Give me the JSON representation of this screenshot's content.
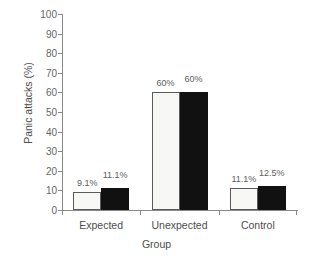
{
  "chart_data": {
    "type": "bar",
    "title": "",
    "xlabel": "Group",
    "ylabel": "Panic attacks (%)",
    "categories": [
      "Expected",
      "Unexpected",
      "Control"
    ],
    "ylim": [
      0,
      100
    ],
    "yticks": [
      0,
      10,
      20,
      30,
      40,
      50,
      60,
      70,
      80,
      90,
      100
    ],
    "ytick_labels": [
      "0",
      "10",
      "20",
      "30",
      "40",
      "50",
      "60",
      "70",
      "80",
      "90",
      "100"
    ],
    "grid": false,
    "legend": null,
    "series": [
      {
        "name": "light",
        "color": "#f7f7f5",
        "edge_color": "#5a5a5a",
        "values": [
          9.1,
          60,
          11.1
        ],
        "value_labels": [
          "9.1%",
          "60%",
          "11.1%"
        ]
      },
      {
        "name": "dark",
        "color": "#111111",
        "edge_color": "#111111",
        "values": [
          11.1,
          60,
          12.5
        ],
        "value_labels": [
          "11.1%",
          "60%",
          "12.5%"
        ]
      }
    ]
  }
}
